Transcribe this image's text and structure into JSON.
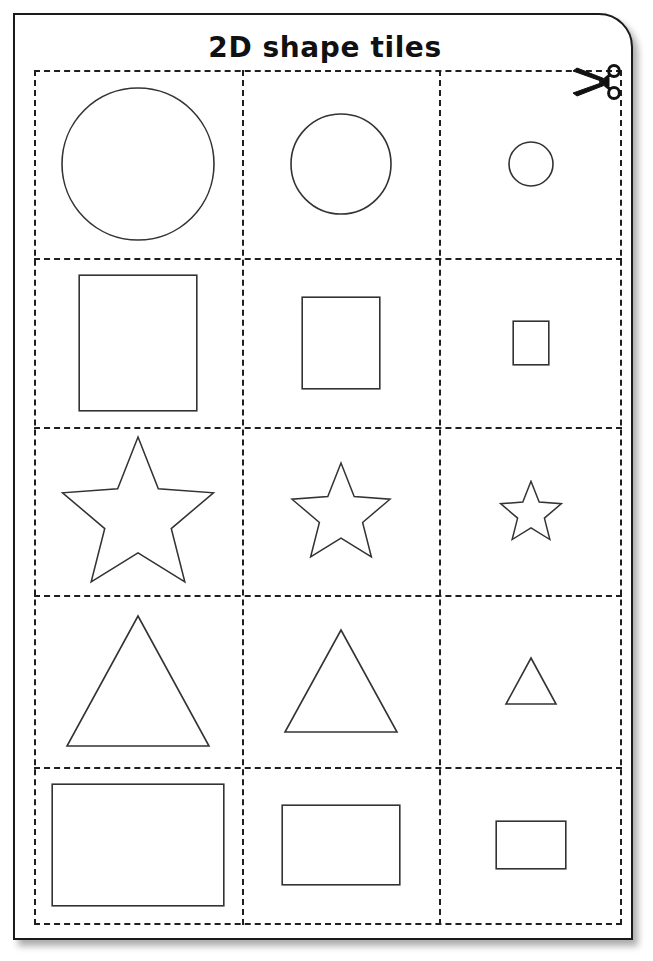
{
  "page": {
    "title": "2D shape tiles",
    "paper_color": "#ffffff",
    "ink_color": "#1a1a1a",
    "shape_stroke_color": "#333333",
    "cut_line_style": "dashed"
  },
  "icons": {
    "scissors": "scissors-icon"
  },
  "grid": {
    "columns": 3,
    "rows": 5,
    "column_labels": [
      "large",
      "medium",
      "small"
    ],
    "row_labels": [
      "circle",
      "square",
      "star",
      "triangle",
      "rectangle"
    ]
  },
  "tiles": [
    {
      "row": 1,
      "shape": "circle",
      "size": "large",
      "name": "circle-large",
      "w": 152,
      "h": 152
    },
    {
      "row": 1,
      "shape": "circle",
      "size": "medium",
      "name": "circle-medium",
      "w": 100,
      "h": 100
    },
    {
      "row": 1,
      "shape": "circle",
      "size": "small",
      "name": "circle-small",
      "w": 44,
      "h": 44
    },
    {
      "row": 2,
      "shape": "square",
      "size": "large",
      "name": "square-large",
      "w": 134,
      "h": 134
    },
    {
      "row": 2,
      "shape": "square",
      "size": "medium",
      "name": "square-medium",
      "w": 88,
      "h": 88
    },
    {
      "row": 2,
      "shape": "square",
      "size": "small",
      "name": "square-small",
      "w": 40,
      "h": 40
    },
    {
      "row": 3,
      "shape": "star",
      "size": "large",
      "name": "star-large",
      "w": 156,
      "h": 150
    },
    {
      "row": 3,
      "shape": "star",
      "size": "medium",
      "name": "star-medium",
      "w": 100,
      "h": 96
    },
    {
      "row": 3,
      "shape": "star",
      "size": "small",
      "name": "star-small",
      "w": 62,
      "h": 60
    },
    {
      "row": 4,
      "shape": "triangle",
      "size": "large",
      "name": "triangle-large",
      "w": 142,
      "h": 130
    },
    {
      "row": 4,
      "shape": "triangle",
      "size": "medium",
      "name": "triangle-medium",
      "w": 112,
      "h": 102
    },
    {
      "row": 4,
      "shape": "triangle",
      "size": "small",
      "name": "triangle-small",
      "w": 50,
      "h": 46
    },
    {
      "row": 5,
      "shape": "rectangle",
      "size": "large",
      "name": "rectangle-large",
      "w": 170,
      "h": 120
    },
    {
      "row": 5,
      "shape": "rectangle",
      "size": "medium",
      "name": "rectangle-medium",
      "w": 116,
      "h": 78
    },
    {
      "row": 5,
      "shape": "rectangle",
      "size": "small",
      "name": "rectangle-small",
      "w": 68,
      "h": 46
    }
  ]
}
